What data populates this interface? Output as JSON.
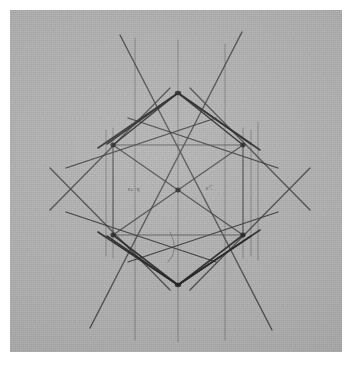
{
  "document": {
    "kind": "scanned-technical-drawing",
    "title": "Geometric construction — symmetric diamond / square projection",
    "media": "pencil and ink on paper",
    "background_color": "#b4b4b4",
    "paper_color": "#b4b4b4",
    "border_color": "#ffffff",
    "ink_color": "#2b2b2b",
    "faint_ink_color": "#5a5a5a"
  },
  "canvas": {
    "width": 352,
    "height": 366,
    "sheet": {
      "x": 10,
      "y": 10,
      "width": 332,
      "height": 342
    }
  },
  "annotations": [
    {
      "name": "annotation-left",
      "text": "εₖ·η"
    },
    {
      "name": "annotation-right",
      "text": "ε·̅ᵣ"
    }
  ],
  "chart_data": {
    "type": "line",
    "xlabel": "",
    "ylabel": "",
    "xlim": [
      0,
      332
    ],
    "ylim": [
      0,
      342
    ],
    "grid": false,
    "legend_position": "none",
    "note": "Coordinates are in sheet-local pixels (origin at top-left of the gray paper).",
    "key_points": {
      "top_apex": [
        168,
        83
      ],
      "bottom_apex": [
        168,
        275
      ],
      "center": [
        168,
        180
      ],
      "square_top_left": [
        103,
        135
      ],
      "square_top_right": [
        233,
        135
      ],
      "square_bottom_left": [
        103,
        225
      ],
      "square_bottom_right": [
        233,
        225
      ],
      "node_left_upper": [
        103,
        135
      ],
      "node_right_upper": [
        233,
        135
      ],
      "node_left_lower": [
        103,
        225
      ],
      "node_right_lower": [
        233,
        225
      ],
      "outer_left_upper": [
        97,
        134
      ],
      "outer_right_upper": [
        241,
        134
      ],
      "outer_left_lower": [
        97,
        226
      ],
      "outer_right_lower": [
        241,
        226
      ]
    },
    "series": [
      {
        "name": "vertical-guides",
        "kind": "segments",
        "weight": 0.9,
        "shade": "faint",
        "segments": [
          [
            [
              125,
              28
            ],
            [
              125,
              330
            ]
          ],
          [
            [
              168,
              30
            ],
            [
              168,
              332
            ]
          ],
          [
            [
              215,
              34
            ],
            [
              215,
              330
            ]
          ],
          [
            [
              103,
              118
            ],
            [
              103,
              248
            ]
          ],
          [
            [
              233,
              118
            ],
            [
              233,
              248
            ]
          ],
          [
            [
              96,
              120
            ],
            [
              96,
              246
            ]
          ],
          [
            [
              241,
              120
            ],
            [
              241,
              246
            ]
          ],
          [
            [
              248,
              112
            ],
            [
              248,
              250
            ]
          ]
        ]
      },
      {
        "name": "square-frame",
        "kind": "segments",
        "weight": 1.1,
        "shade": "mid",
        "segments": [
          [
            [
              103,
              135
            ],
            [
              233,
              135
            ]
          ],
          [
            [
              103,
              225
            ],
            [
              233,
              225
            ]
          ],
          [
            [
              103,
              135
            ],
            [
              103,
              225
            ]
          ],
          [
            [
              233,
              135
            ],
            [
              233,
              225
            ]
          ]
        ]
      },
      {
        "name": "square-diagonals",
        "kind": "segments",
        "weight": 1.2,
        "shade": "dark",
        "segments": [
          [
            [
              103,
              135
            ],
            [
              233,
              225
            ]
          ],
          [
            [
              233,
              135
            ],
            [
              103,
              225
            ]
          ]
        ]
      },
      {
        "name": "center-cross",
        "kind": "segments",
        "weight": 1.0,
        "shade": "mid",
        "segments": [
          [
            [
              103,
              180
            ],
            [
              233,
              180
            ]
          ]
        ]
      },
      {
        "name": "upper-rays",
        "kind": "segments",
        "weight": 1.6,
        "shade": "dark",
        "segments": [
          [
            [
              168,
              83
            ],
            [
              97,
              134
            ]
          ],
          [
            [
              168,
              83
            ],
            [
              241,
              134
            ]
          ],
          [
            [
              168,
              83
            ],
            [
              103,
              135
            ]
          ],
          [
            [
              168,
              83
            ],
            [
              233,
              135
            ]
          ],
          [
            [
              168,
              83
            ],
            [
              250,
              140
            ]
          ],
          [
            [
              168,
              83
            ],
            [
              88,
              138
            ]
          ]
        ]
      },
      {
        "name": "lower-rays",
        "kind": "segments",
        "weight": 1.6,
        "shade": "dark",
        "segments": [
          [
            [
              168,
              275
            ],
            [
              97,
              226
            ]
          ],
          [
            [
              168,
              275
            ],
            [
              241,
              226
            ]
          ],
          [
            [
              168,
              275
            ],
            [
              103,
              225
            ]
          ],
          [
            [
              168,
              275
            ],
            [
              233,
              225
            ]
          ],
          [
            [
              168,
              275
            ],
            [
              250,
              220
            ]
          ],
          [
            [
              168,
              275
            ],
            [
              88,
              222
            ]
          ]
        ]
      },
      {
        "name": "long-diagonals",
        "kind": "segments",
        "weight": 1.4,
        "shade": "dark",
        "segments": [
          [
            [
              110,
              25
            ],
            [
              262,
              320
            ]
          ],
          [
            [
              232,
              22
            ],
            [
              80,
              318
            ]
          ],
          [
            [
              40,
              200
            ],
            [
              160,
              78
            ]
          ],
          [
            [
              40,
              158
            ],
            [
              160,
              280
            ]
          ],
          [
            [
              300,
              200
            ],
            [
              180,
              78
            ]
          ],
          [
            [
              300,
              158
            ],
            [
              180,
              280
            ]
          ]
        ]
      },
      {
        "name": "outer-tangents",
        "kind": "segments",
        "weight": 1.3,
        "shade": "dark",
        "segments": [
          [
            [
              118,
              108
            ],
            [
              268,
              158
            ]
          ],
          [
            [
              118,
              252
            ],
            [
              268,
              202
            ]
          ],
          [
            [
              56,
              158
            ],
            [
              206,
              108
            ]
          ],
          [
            [
              56,
              202
            ],
            [
              206,
              252
            ]
          ]
        ]
      },
      {
        "name": "arc-mark",
        "kind": "arc",
        "weight": 0.9,
        "shade": "faint",
        "path": "M 160 222 Q 170 240 158 252"
      }
    ],
    "nodes": [
      {
        "at": [
          168,
          83
        ],
        "label": "top apex"
      },
      {
        "at": [
          168,
          275
        ],
        "label": "bottom apex"
      },
      {
        "at": [
          168,
          180
        ],
        "label": "center"
      },
      {
        "at": [
          103,
          135
        ],
        "label": "upper-left node"
      },
      {
        "at": [
          233,
          135
        ],
        "label": "upper-right node"
      },
      {
        "at": [
          103,
          225
        ],
        "label": "lower-left node"
      },
      {
        "at": [
          233,
          225
        ],
        "label": "lower-right node"
      }
    ]
  }
}
